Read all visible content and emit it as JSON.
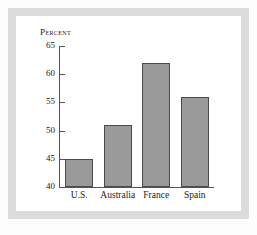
{
  "chart_data": {
    "type": "bar",
    "title": "Percent",
    "xlabel": "",
    "ylabel": "",
    "categories": [
      "U.S.",
      "Australia",
      "France",
      "Spain"
    ],
    "values": [
      45,
      51,
      62,
      56
    ],
    "ylim": [
      40,
      65
    ],
    "yticks": [
      65,
      60,
      55,
      50,
      45,
      40
    ],
    "ytick_labels": [
      "65",
      "60",
      "55",
      "50",
      "45",
      "40"
    ],
    "grid": false,
    "legend": null,
    "bar_color": "#9a9a9a",
    "bar_edge_color": "#4a4a4a",
    "axis_color": "#555555",
    "frame_color": "#dcdcdc",
    "background_color": "#ffffff"
  }
}
